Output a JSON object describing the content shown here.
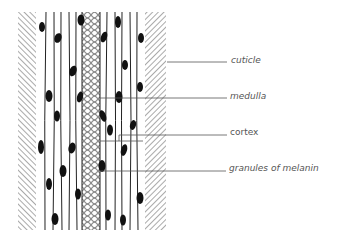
{
  "diagram": {
    "labels": [
      {
        "id": "cuticle",
        "text": "cuticle",
        "x": 231,
        "y": 56
      },
      {
        "id": "medulla",
        "text": "medulla",
        "x": 230,
        "y": 92
      },
      {
        "id": "cortex",
        "text": "cortex",
        "x": 230,
        "y": 128
      },
      {
        "id": "granules",
        "text": "granules of melanin",
        "x": 229,
        "y": 164
      }
    ],
    "colors": {
      "ink": "#1a1a1a",
      "hatch": "#555555",
      "leader": "#555555",
      "text": "#555555"
    }
  }
}
